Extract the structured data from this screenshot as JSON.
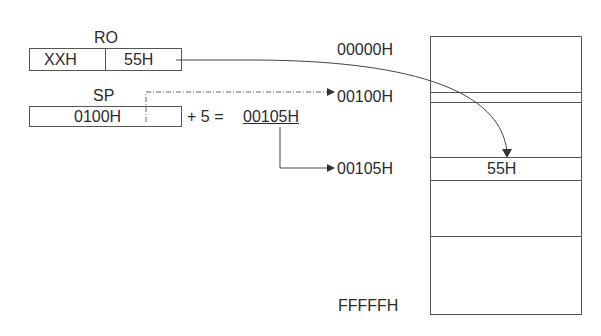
{
  "registers": {
    "r0": {
      "name": "RO",
      "high": "XXH",
      "low": "55H"
    },
    "sp": {
      "name": "SP",
      "value": "0100H"
    }
  },
  "calc": {
    "expression": "+ 5 =",
    "result": "00105H"
  },
  "memory": {
    "addresses": {
      "start": "00000H",
      "sp_addr": "00100H",
      "target": "00105H",
      "end": "FFFFFH"
    },
    "target_value": "55H"
  }
}
